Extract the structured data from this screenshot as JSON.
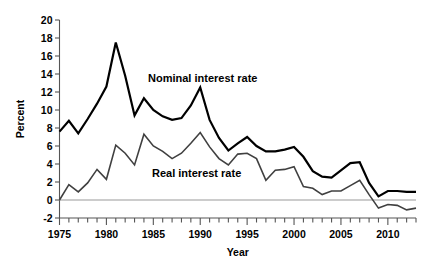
{
  "chart_data": {
    "type": "line",
    "title": "",
    "xlabel": "Year",
    "ylabel": "Percent",
    "xlim": [
      1975,
      2013
    ],
    "ylim": [
      -2,
      20
    ],
    "y_ticks": [
      -2,
      0,
      2,
      4,
      6,
      8,
      10,
      12,
      14,
      16,
      18,
      20
    ],
    "y_tick_labels": [
      "-2",
      "0",
      "2",
      "4",
      "6",
      "8",
      "10",
      "12",
      "14",
      "16",
      "18",
      "20"
    ],
    "x_ticks": [
      1975,
      1980,
      1985,
      1990,
      1995,
      2000,
      2005,
      2010
    ],
    "x_tick_labels": [
      "1975",
      "1980",
      "1985",
      "1990",
      "1995",
      "2000",
      "2005",
      "2010"
    ],
    "x_minor_tick_interval": 1,
    "grid": false,
    "legend_position": "inline-annotations",
    "zero_line": 0,
    "x": [
      1975,
      1976,
      1977,
      1978,
      1979,
      1980,
      1981,
      1982,
      1983,
      1984,
      1985,
      1986,
      1987,
      1988,
      1989,
      1990,
      1991,
      1992,
      1993,
      1994,
      1995,
      1996,
      1997,
      1998,
      1999,
      2000,
      2001,
      2002,
      2003,
      2004,
      2005,
      2006,
      2007,
      2008,
      2009,
      2010,
      2011,
      2012,
      2013
    ],
    "series": [
      {
        "name": "Nominal interest rate",
        "color": "#000000",
        "line_width": 2.2,
        "annotation": "Nominal interest rate",
        "values": [
          7.6,
          8.8,
          7.4,
          9.0,
          10.7,
          12.6,
          17.5,
          13.8,
          9.4,
          11.3,
          10.0,
          9.3,
          8.9,
          9.1,
          10.5,
          12.5,
          8.9,
          6.9,
          5.5,
          6.3,
          7.0,
          6.0,
          5.4,
          5.4,
          5.6,
          5.9,
          4.8,
          3.2,
          2.6,
          2.5,
          3.3,
          4.1,
          4.2,
          1.9,
          0.4,
          1.0,
          1.0,
          0.9,
          0.9
        ]
      },
      {
        "name": "Real interest rate",
        "color": "#404040",
        "line_width": 1.6,
        "annotation": "Real interest rate",
        "values": [
          0.0,
          1.7,
          0.9,
          1.9,
          3.4,
          2.3,
          6.1,
          5.2,
          3.9,
          7.3,
          6.0,
          5.4,
          4.6,
          5.2,
          6.3,
          7.5,
          5.9,
          4.6,
          3.9,
          5.1,
          5.2,
          4.6,
          2.2,
          3.3,
          3.4,
          3.7,
          1.5,
          1.3,
          0.6,
          1.0,
          1.0,
          1.6,
          2.2,
          0.6,
          -0.9,
          -0.5,
          -0.6,
          -1.1,
          -0.9
        ]
      }
    ]
  },
  "axes": {
    "y_label": "Percent",
    "x_label": "Year"
  }
}
